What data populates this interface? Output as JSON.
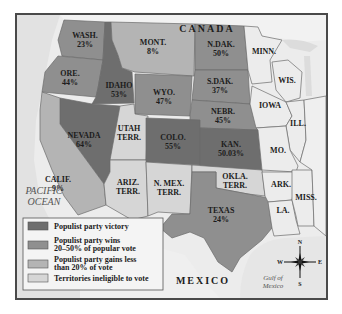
{
  "map": {
    "labels": {
      "canada": "CANADA",
      "mexico": "MEXICO",
      "pacific_ocean": [
        "PACIFIC",
        "OCEAN"
      ],
      "gulf_of_mexico": [
        "Gulf of",
        "Mexico"
      ]
    },
    "category_colors": {
      "victory": "#6e6e6e",
      "wins_20_50": "#8f8f8f",
      "less_than_20": "#b4b4b4",
      "ineligible": "#d6d6d6",
      "not_highlighted": "#ececec",
      "land": "#f3f3f3",
      "ocean": "#e4e4e4"
    },
    "regions": [
      {
        "id": "wash",
        "name": "WASH.",
        "value": "23%",
        "category": "wins_20_50"
      },
      {
        "id": "ore",
        "name": "ORE.",
        "value": "44%",
        "category": "wins_20_50"
      },
      {
        "id": "idaho",
        "name": "IDAHO",
        "value": "53%",
        "category": "victory"
      },
      {
        "id": "mont",
        "name": "MONT.",
        "value": "8%",
        "category": "less_than_20"
      },
      {
        "id": "wyo",
        "name": "WYO.",
        "value": "47%",
        "category": "wins_20_50"
      },
      {
        "id": "ndak",
        "name": "N.DAK.",
        "value": "50%",
        "category": "wins_20_50"
      },
      {
        "id": "sdak",
        "name": "S.DAK.",
        "value": "37%",
        "category": "wins_20_50"
      },
      {
        "id": "nebr",
        "name": "NEBR.",
        "value": "45%",
        "category": "wins_20_50"
      },
      {
        "id": "nevada",
        "name": "NEVADA",
        "value": "64%",
        "category": "victory"
      },
      {
        "id": "utah",
        "name": "UTAH",
        "value": "TERR.",
        "category": "ineligible"
      },
      {
        "id": "colo",
        "name": "COLO.",
        "value": "55%",
        "category": "victory"
      },
      {
        "id": "kan",
        "name": "KAN.",
        "value": "50.03%",
        "category": "victory"
      },
      {
        "id": "calif",
        "name": "CALIF.",
        "value": "9%",
        "category": "less_than_20"
      },
      {
        "id": "ariz",
        "name": "ARIZ.",
        "value": "TERR.",
        "category": "ineligible"
      },
      {
        "id": "nmex",
        "name": "N. MEX.",
        "value": "TERR.",
        "category": "ineligible"
      },
      {
        "id": "okla",
        "name": "OKLA.",
        "value": "TERR.",
        "category": "ineligible"
      },
      {
        "id": "texas",
        "name": "TEXAS",
        "value": "24%",
        "category": "wins_20_50"
      },
      {
        "id": "minn",
        "name": "MINN.",
        "value": "",
        "category": "not_highlighted"
      },
      {
        "id": "wis",
        "name": "WIS.",
        "value": "",
        "category": "not_highlighted"
      },
      {
        "id": "iowa",
        "name": "IOWA",
        "value": "",
        "category": "not_highlighted"
      },
      {
        "id": "ill",
        "name": "ILL.",
        "value": "",
        "category": "not_highlighted"
      },
      {
        "id": "mo",
        "name": "MO.",
        "value": "",
        "category": "not_highlighted"
      },
      {
        "id": "ark",
        "name": "ARK.",
        "value": "",
        "category": "not_highlighted"
      },
      {
        "id": "la",
        "name": "LA.",
        "value": "",
        "category": "not_highlighted"
      },
      {
        "id": "miss",
        "name": "MISS.",
        "value": "",
        "category": "not_highlighted"
      }
    ],
    "legend": [
      {
        "category": "victory",
        "lines": [
          "Populist party victory"
        ]
      },
      {
        "category": "wins_20_50",
        "lines": [
          "Populist party wins",
          "20–50% of popular vote"
        ]
      },
      {
        "category": "less_than_20",
        "lines": [
          "Populist party gains less",
          "than 20% of vote"
        ]
      },
      {
        "category": "ineligible",
        "lines": [
          "Territories ineligible to vote"
        ]
      }
    ],
    "compass": {
      "n": "N",
      "s": "S",
      "e": "E",
      "w": "W"
    }
  }
}
